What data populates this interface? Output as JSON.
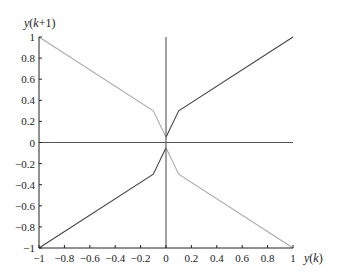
{
  "chart_data": {
    "type": "line",
    "title": "",
    "xlabel": "y(k)",
    "ylabel": "y(k+1)",
    "xlim": [
      -1,
      1
    ],
    "ylim": [
      -1,
      1
    ],
    "grid": false,
    "legend": null,
    "xticks": [
      -1,
      -0.8,
      -0.6,
      -0.4,
      -0.2,
      0,
      0.2,
      0.4,
      0.6,
      0.8,
      1
    ],
    "yticks": [
      -1,
      -0.8,
      -0.6,
      -0.4,
      -0.2,
      0,
      0.2,
      0.4,
      0.6,
      0.8,
      1
    ],
    "xtick_labels": [
      "-1",
      "-0.8",
      "-0.6",
      "-0.4",
      "-0.2",
      "0",
      "0.2",
      "0.4",
      "0.6",
      "0.8",
      "1"
    ],
    "ytick_labels": [
      "-1",
      "-0.8",
      "-0.6",
      "-0.4",
      "-0.2",
      "0",
      "0.2",
      "0.4",
      "0.6",
      "0.8",
      "1"
    ],
    "series": [
      {
        "name": "upper-right",
        "color": "#444444",
        "x": [
          0,
          0.1,
          1
        ],
        "y": [
          0.05,
          0.3,
          1
        ]
      },
      {
        "name": "upper-left",
        "color": "#aaaaaa",
        "x": [
          -1,
          -0.1,
          0
        ],
        "y": [
          1,
          0.3,
          0.05
        ]
      },
      {
        "name": "lower-left",
        "color": "#444444",
        "x": [
          -1,
          -0.1,
          0
        ],
        "y": [
          -1,
          -0.3,
          -0.05
        ]
      },
      {
        "name": "lower-right",
        "color": "#aaaaaa",
        "x": [
          0,
          0.1,
          1
        ],
        "y": [
          -0.05,
          -0.3,
          -1
        ]
      },
      {
        "name": "vertical-zero-line",
        "color": "#555555",
        "x": [
          0,
          0
        ],
        "y": [
          -1,
          1
        ]
      },
      {
        "name": "horizontal-zero-line",
        "color": "#555555",
        "x": [
          -1,
          1
        ],
        "y": [
          0,
          0
        ]
      }
    ]
  }
}
